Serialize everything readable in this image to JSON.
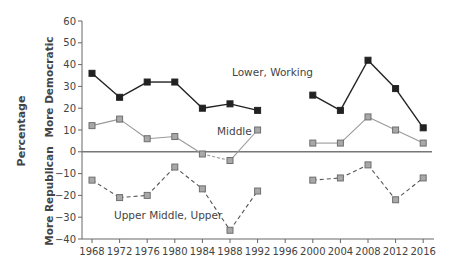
{
  "chart_data": {
    "type": "line",
    "title": "",
    "xlabel": "",
    "ylabel": "Percentage",
    "ylabel_upper": "More Democratic",
    "ylabel_lower": "More Republican",
    "ylim": [
      -40,
      60
    ],
    "yticks": [
      60,
      50,
      40,
      30,
      20,
      10,
      0,
      -10,
      -20,
      -30,
      -40
    ],
    "x": [
      1968,
      1972,
      1976,
      1980,
      1984,
      1988,
      1992,
      1996,
      2000,
      2004,
      2008,
      2012,
      2016
    ],
    "grid": false,
    "legend": "inline labels",
    "series": [
      {
        "name": "Lower, Working",
        "style": "solid, dark squares",
        "color": "#222222",
        "values": [
          36,
          25,
          32,
          32,
          20,
          22,
          19,
          null,
          26,
          19,
          42,
          29,
          11
        ]
      },
      {
        "name": "Middle",
        "style": "solid gray line, gray squares",
        "color": "#999999",
        "values": [
          12,
          15,
          6,
          7,
          -1,
          -4,
          10,
          null,
          4,
          4,
          16,
          10,
          4
        ]
      },
      {
        "name": "Upper Middle, Upper",
        "style": "dashed, gray squares",
        "color": "#444444",
        "values": [
          -13,
          -21,
          -20,
          -7,
          -17,
          -36,
          -18,
          null,
          -13,
          -12,
          -6,
          -22,
          -12
        ]
      }
    ]
  }
}
